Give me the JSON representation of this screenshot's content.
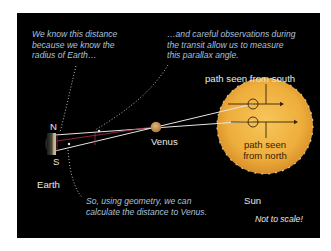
{
  "diagram": {
    "captions": {
      "top_left": [
        "We know this distance",
        "because we know the",
        "radius of Earth…"
      ],
      "top_right": [
        "…and careful observations during",
        "the transit allow us to measure",
        "this parallax angle."
      ],
      "bottom": [
        "So, using geometry, we can",
        "calculate the distance to Venus."
      ]
    },
    "labels": {
      "north": "N",
      "south": "S",
      "earth": "Earth",
      "venus": "Venus",
      "sun": "Sun",
      "path_south": "path seen from south",
      "path_north_line1": "path seen",
      "path_north_line2": "from north",
      "not_to_scale": "Not to scale!"
    },
    "icons": {
      "earth": "earth-half-disk-icon",
      "venus": "venus-disk-icon",
      "sun": "sun-disk-icon"
    },
    "colors": {
      "background": "#000000",
      "caption": "#a9c1dc",
      "label": "#e8e8e8",
      "sun": "#f0b440",
      "venus": "#c99a5a",
      "sightline": "#e6e6e6",
      "parallax_angle": "#b0304a",
      "sun_label": "#3a2205"
    }
  }
}
